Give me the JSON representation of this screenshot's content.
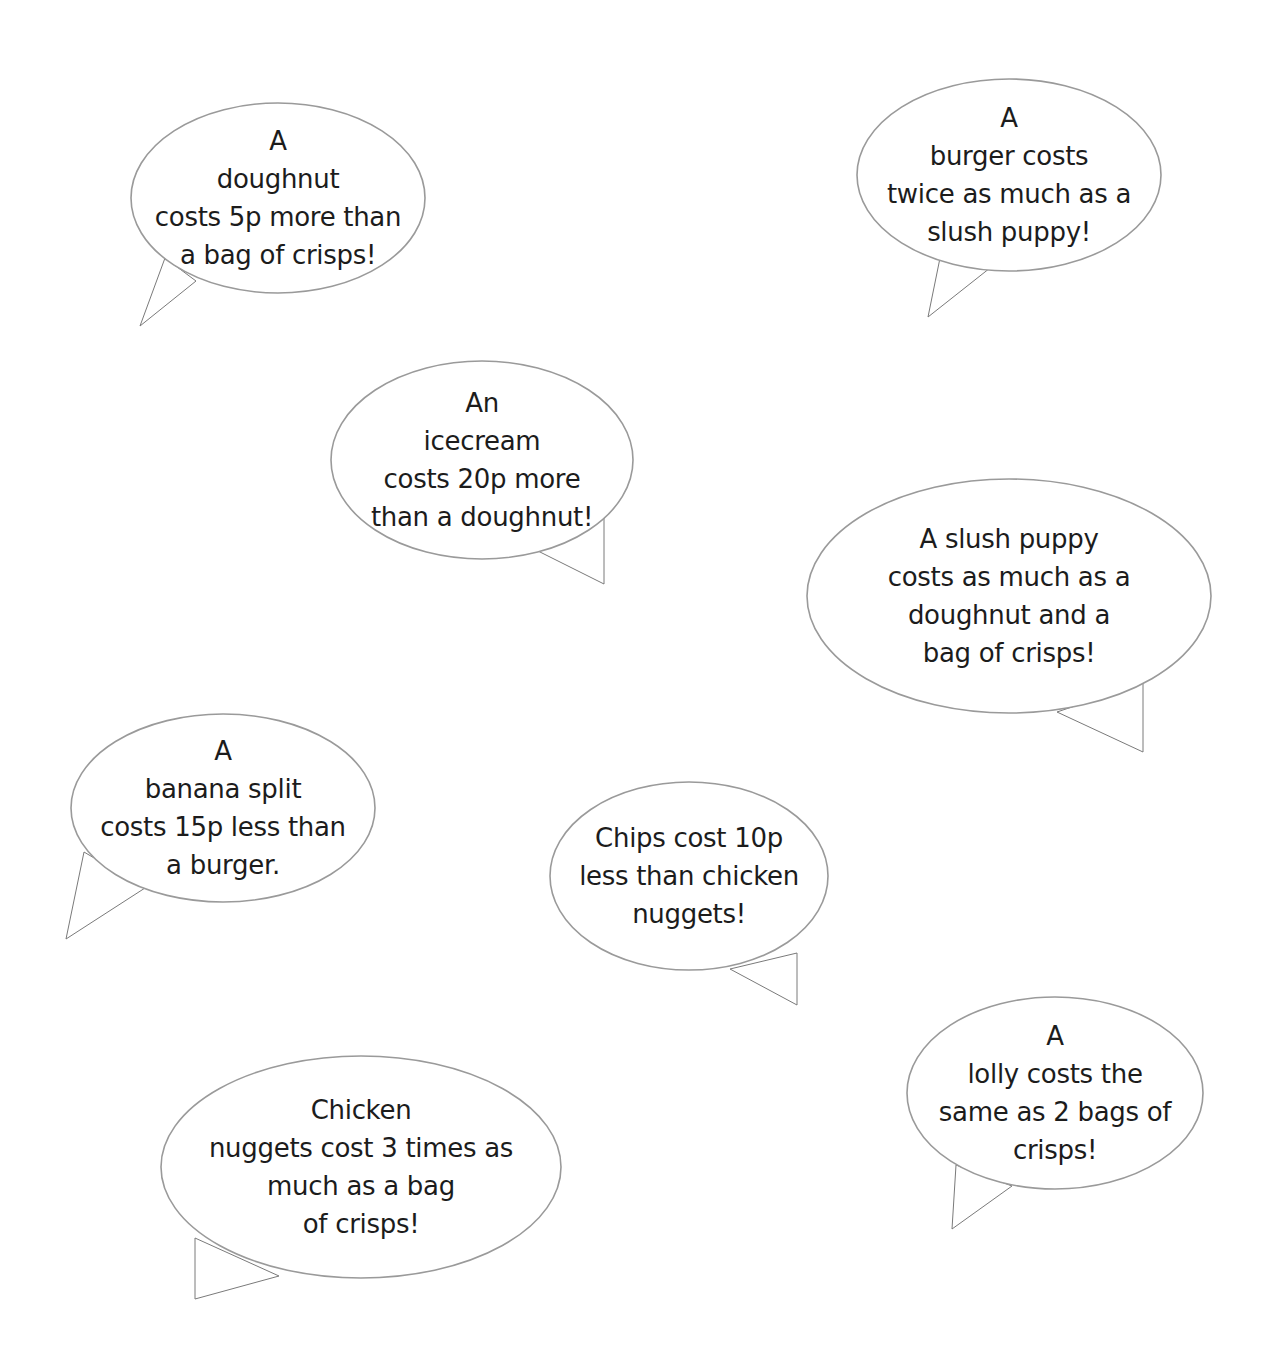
{
  "bubbles": [
    {
      "id": "doughnut",
      "lines": [
        "A",
        "doughnut",
        "costs 5p more than",
        "a bag of crisps!"
      ],
      "ellipse": {
        "cx": 278,
        "cy": 198,
        "rx": 147,
        "ry": 95
      },
      "tail": [
        [
          165,
          258
        ],
        [
          140,
          326
        ],
        [
          196,
          281
        ]
      ]
    },
    {
      "id": "burger",
      "lines": [
        "A",
        "burger costs",
        "twice as much as a",
        "slush puppy!"
      ],
      "ellipse": {
        "cx": 1009,
        "cy": 175,
        "rx": 152,
        "ry": 96
      },
      "tail": [
        [
          940,
          258
        ],
        [
          928,
          317
        ],
        [
          990,
          268
        ]
      ]
    },
    {
      "id": "icecream",
      "lines": [
        "An",
        "icecream",
        "costs 20p more",
        "than a doughnut!"
      ],
      "ellipse": {
        "cx": 482,
        "cy": 460,
        "rx": 151,
        "ry": 99
      },
      "tail": [
        [
          604,
          518
        ],
        [
          604,
          584
        ],
        [
          538,
          551
        ]
      ]
    },
    {
      "id": "slush-puppy",
      "lines": [
        "A slush puppy",
        "costs as much as a",
        "doughnut and a",
        "bag of crisps!"
      ],
      "ellipse": {
        "cx": 1009,
        "cy": 596,
        "rx": 202,
        "ry": 117
      },
      "tail": [
        [
          1143,
          683
        ],
        [
          1143,
          752
        ],
        [
          1057,
          712
        ]
      ]
    },
    {
      "id": "banana-split",
      "lines": [
        "A",
        "banana split",
        "costs 15p less than",
        "a burger."
      ],
      "ellipse": {
        "cx": 223,
        "cy": 808,
        "rx": 152,
        "ry": 94
      },
      "tail": [
        [
          84,
          852
        ],
        [
          66,
          939
        ],
        [
          145,
          888
        ]
      ]
    },
    {
      "id": "chips",
      "lines": [
        "Chips cost 10p",
        "less than chicken",
        "nuggets!"
      ],
      "ellipse": {
        "cx": 689,
        "cy": 876,
        "rx": 139,
        "ry": 94
      },
      "tail": [
        [
          797,
          953
        ],
        [
          797,
          1005
        ],
        [
          730,
          969
        ]
      ]
    },
    {
      "id": "lolly",
      "lines": [
        "A",
        "lolly costs the",
        "same as 2 bags of",
        "crisps!"
      ],
      "ellipse": {
        "cx": 1055,
        "cy": 1093,
        "rx": 148,
        "ry": 96
      },
      "tail": [
        [
          956,
          1165
        ],
        [
          952,
          1229
        ],
        [
          1012,
          1186
        ]
      ]
    },
    {
      "id": "chicken-nuggets",
      "lines": [
        "Chicken",
        "nuggets cost 3 times as",
        "much as a bag",
        "of crisps!"
      ],
      "ellipse": {
        "cx": 361,
        "cy": 1167,
        "rx": 200,
        "ry": 111
      },
      "tail": [
        [
          195,
          1238
        ],
        [
          195,
          1299
        ],
        [
          279,
          1276
        ]
      ]
    }
  ],
  "colors": {
    "bubble_stroke": "#9a9a9a",
    "tail_stroke": "#7a7a7a",
    "text": "#1c1c1c",
    "background": "#ffffff"
  }
}
